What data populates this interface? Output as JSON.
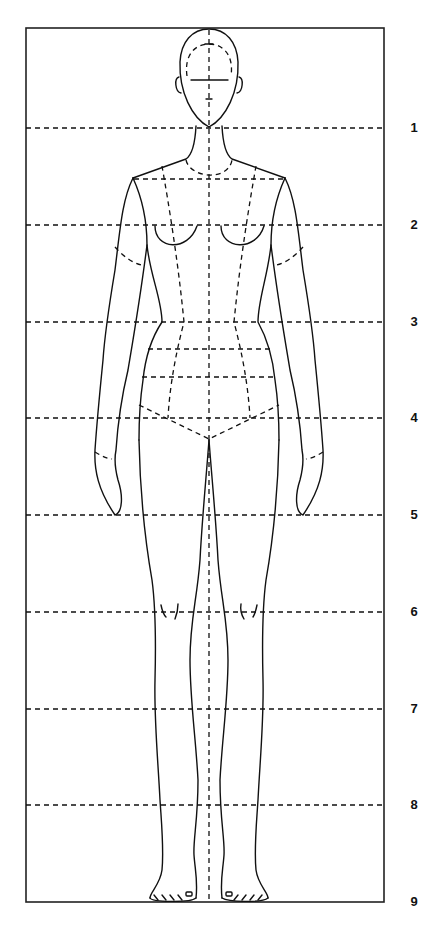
{
  "diagram": {
    "frame": {
      "x": 26,
      "y": 28,
      "width": 358,
      "height": 874
    },
    "center_x": 209,
    "stroke_color": "#111111",
    "background": "#ffffff"
  },
  "guide_lines": [
    {
      "label": "1",
      "y": 128
    },
    {
      "label": "2",
      "y": 225
    },
    {
      "label": "3",
      "y": 322
    },
    {
      "label": "4",
      "y": 418
    },
    {
      "label": "5",
      "y": 515
    },
    {
      "label": "6",
      "y": 612
    },
    {
      "label": "7",
      "y": 709
    },
    {
      "label": "8",
      "y": 805
    },
    {
      "label": "9",
      "y": 902
    }
  ]
}
